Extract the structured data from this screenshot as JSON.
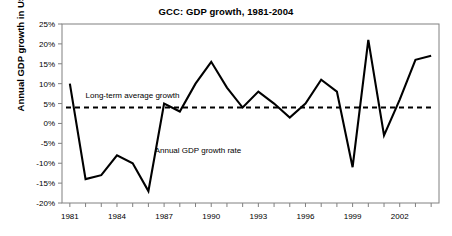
{
  "chart_data": {
    "type": "line",
    "title": "GCC: GDP growth, 1981-2004",
    "xlabel": "",
    "ylabel": "Annual GDP growth in US$",
    "x": [
      1981,
      1982,
      1983,
      1984,
      1985,
      1986,
      1987,
      1988,
      1989,
      1990,
      1991,
      1992,
      1993,
      1994,
      1995,
      1996,
      1997,
      1998,
      1999,
      2000,
      2001,
      2002,
      2003,
      2004
    ],
    "series": [
      {
        "name": "Annual GDP growth rate",
        "values": [
          10,
          -14,
          -13,
          -8,
          -10,
          -17,
          5,
          3,
          10,
          15.5,
          9,
          4,
          8,
          5,
          1.5,
          5,
          11,
          8,
          -11,
          21,
          -3,
          6,
          16,
          17
        ]
      },
      {
        "name": "Long-term average growth",
        "type": "constant",
        "value": 4
      }
    ],
    "xlim": [
      1980.5,
      2004.5
    ],
    "ylim": [
      -20,
      25
    ],
    "ytick_labels": [
      "25%",
      "20%",
      "15%",
      "10%",
      "5%",
      "0%",
      "-5%",
      "-10%",
      "-15%",
      "-20%"
    ],
    "ytick_values": [
      25,
      20,
      15,
      10,
      5,
      0,
      -5,
      -10,
      -15,
      -20
    ],
    "xtick_labels": [
      "1981",
      "1984",
      "1987",
      "1990",
      "1993",
      "1996",
      "1999",
      "2002"
    ],
    "xtick_values": [
      1981,
      1984,
      1987,
      1990,
      1993,
      1996,
      1999,
      2002
    ],
    "grid": false,
    "legend_position": "none",
    "annotations": [
      {
        "text": "Long-term average growth",
        "x": 1982.0,
        "y": 6.5
      },
      {
        "text": "Annual GDP growth rate",
        "x": 1986.4,
        "y": -7.5
      }
    ],
    "colors": {
      "line": "#000000",
      "average_line": "#000000",
      "axis": "#808080",
      "background": "#ffffff"
    }
  }
}
